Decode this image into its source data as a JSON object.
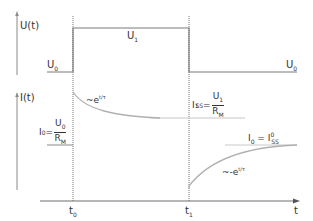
{
  "diagram": {
    "colors": {
      "axis": "#6e6e6e",
      "signal": "#7a7a7a",
      "curve": "#b0b0b0",
      "text": "#333333"
    },
    "upper_plot": {
      "axis_label": "U(t)",
      "levels": [
        {
          "name": "U0_left",
          "label": "U",
          "sub": "0"
        },
        {
          "name": "U1",
          "label": "U",
          "sub": "1"
        },
        {
          "name": "U0_right",
          "label": "U",
          "sub": "0"
        }
      ]
    },
    "lower_plot": {
      "axis_label": "I(t)",
      "initial_current": {
        "lhs": "I",
        "lhs_sub": "0",
        "eq": "=",
        "num": "U",
        "num_sub": "0",
        "den": "R",
        "den_sup": "0",
        "den_sub": "M"
      },
      "steady_state_1": {
        "lhs": "I",
        "lhs_sub": "SS",
        "lhs_sup": "1",
        "eq": "=",
        "num": "U",
        "num_sub": "1",
        "den": "R",
        "den_sup": "1",
        "den_sub": "M"
      },
      "steady_state_0": {
        "lhs": "I",
        "lhs_sub": "0",
        "eq": "=",
        "rhs": "I",
        "rhs_sub": "SS",
        "rhs_sup": "0"
      },
      "decay_annotation": {
        "prefix": "~e",
        "exponent": "t/τ"
      },
      "rise_annotation": {
        "prefix": "~-e",
        "exponent": "t/τ"
      }
    },
    "time_axis": {
      "label": "t",
      "ticks": [
        {
          "label": "t",
          "sub": "0"
        },
        {
          "label": "t",
          "sub": "1"
        }
      ]
    }
  }
}
